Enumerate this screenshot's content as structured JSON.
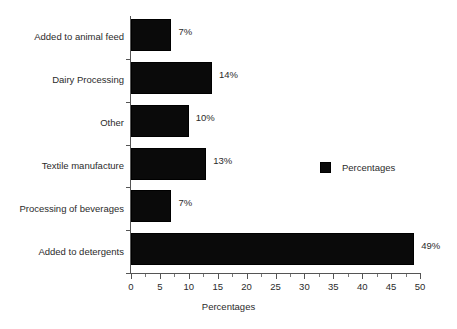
{
  "chart_data": {
    "type": "bar",
    "orientation": "horizontal",
    "title": "",
    "xlabel": "Percentages",
    "ylabel": "",
    "xlim": [
      0,
      50
    ],
    "xticks": [
      0,
      5,
      10,
      15,
      20,
      25,
      30,
      35,
      40,
      45,
      50
    ],
    "xtick_labels": [
      "0",
      "5",
      "10",
      "15",
      "20",
      "25",
      "30",
      "35",
      "40",
      "45",
      "50"
    ],
    "minor_ticks_per_interval": 1,
    "grid": false,
    "categories": [
      "Added to animal feed",
      "Dairy Processing",
      "Other",
      "Textile manufacture",
      "Processing of beverages",
      "Added to detergents"
    ],
    "values": [
      7,
      14,
      10,
      13,
      7,
      49
    ],
    "data_labels": [
      "7%",
      "14%",
      "10%",
      "13%",
      "7%",
      "49%"
    ],
    "series": [
      {
        "name": "Percentages",
        "values": [
          7,
          14,
          10,
          13,
          7,
          49
        ],
        "color": "#0a0a0a"
      }
    ],
    "legend": {
      "position": "right-center",
      "entries": [
        {
          "label": "Percentages",
          "color": "#0a0a0a"
        }
      ]
    },
    "colors": {
      "bar": "#0a0a0a",
      "axis": "#555555",
      "text": "#2b2b2b",
      "background": "#ffffff"
    }
  }
}
